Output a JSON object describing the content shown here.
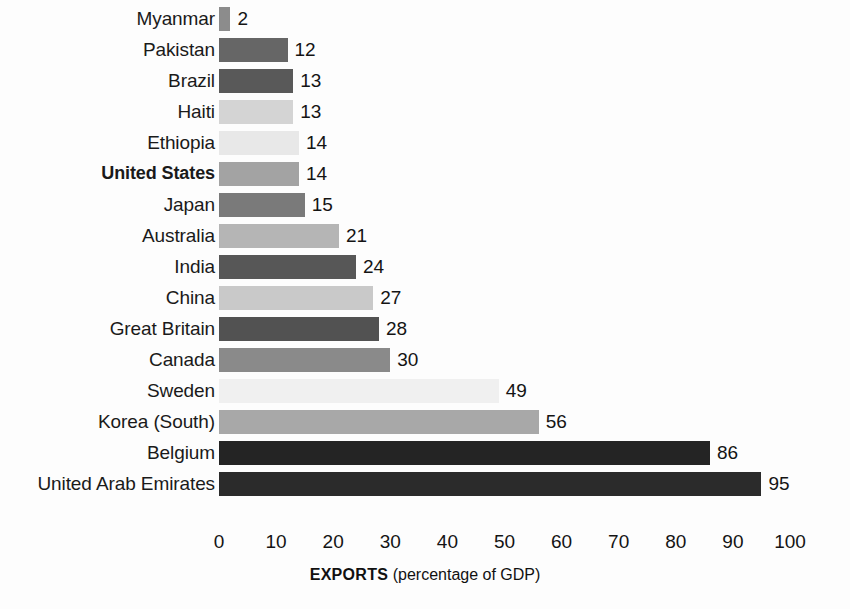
{
  "chart_data": {
    "type": "bar",
    "orientation": "horizontal",
    "title": "",
    "xlabel": "EXPORTS (percentage of GDP)",
    "ylabel": "",
    "xlim": [
      0,
      100
    ],
    "grid": false,
    "legend": false,
    "categories": [
      "Myanmar",
      "Pakistan",
      "Brazil",
      "Haiti",
      "Ethiopia",
      "United States",
      "Japan",
      "Australia",
      "India",
      "China",
      "Great Britain",
      "Canada",
      "Sweden",
      "Korea (South)",
      "Belgium",
      "United Arab Emirates"
    ],
    "values": [
      2,
      12,
      13,
      13,
      14,
      14,
      15,
      21,
      24,
      27,
      28,
      30,
      49,
      56,
      86,
      95
    ],
    "bar_colors": [
      "#8c8c8c",
      "#666666",
      "#595959",
      "#d4d4d4",
      "#e8e8e8",
      "#a3a3a3",
      "#7a7a7a",
      "#b5b5b5",
      "#575757",
      "#c9c9c9",
      "#525252",
      "#8a8a8a",
      "#f0f0f0",
      "#a8a8a8",
      "#242424",
      "#2b2b2b"
    ],
    "highlighted_category": "United States",
    "tick_labels": [
      "0",
      "10",
      "20",
      "30",
      "40",
      "50",
      "60",
      "70",
      "80",
      "90",
      "100"
    ],
    "tick_values": [
      0,
      10,
      20,
      30,
      40,
      50,
      60,
      70,
      80,
      90,
      100
    ]
  },
  "axis_caption": {
    "main": "EXPORTS",
    "sub": " (percentage of GDP)"
  }
}
